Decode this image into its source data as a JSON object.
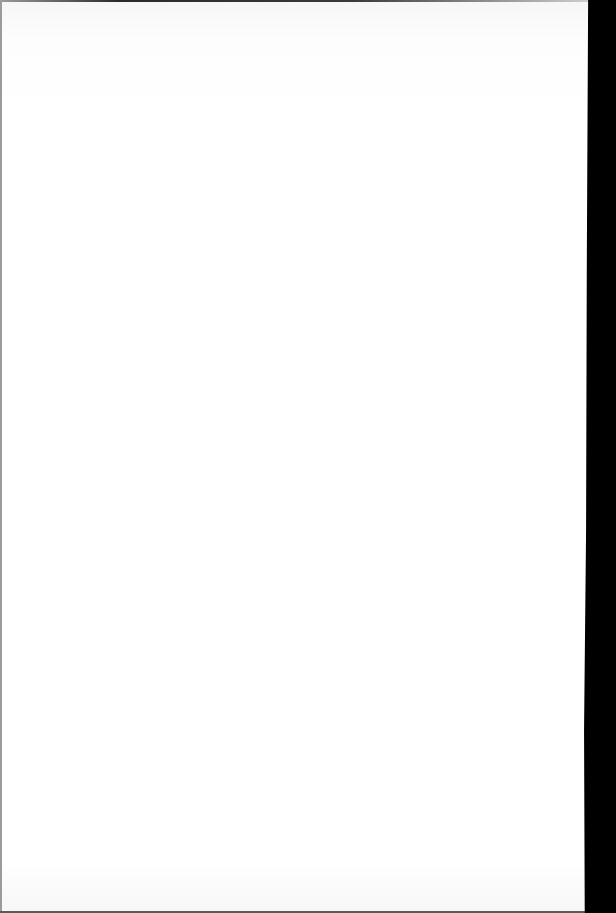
{
  "document": {
    "type": "scanned-page",
    "content": "blank",
    "visible_text": [],
    "show_through_marks": [
      {
        "x": 58,
        "y": 148,
        "text": ""
      },
      {
        "x": 208,
        "y": 147,
        "text": ""
      },
      {
        "x": 470,
        "y": 147,
        "text": ""
      },
      {
        "x": 236,
        "y": 163,
        "text": ""
      },
      {
        "x": 505,
        "y": 163,
        "text": ""
      }
    ]
  },
  "colors": {
    "paper": "#ffffff",
    "right_scan_border": "#000000",
    "top_edge": "#2a2a2a",
    "left_edge": "#9b9b9b",
    "bottom_edge": "#5a5a5a",
    "show_through": "#ececec"
  }
}
